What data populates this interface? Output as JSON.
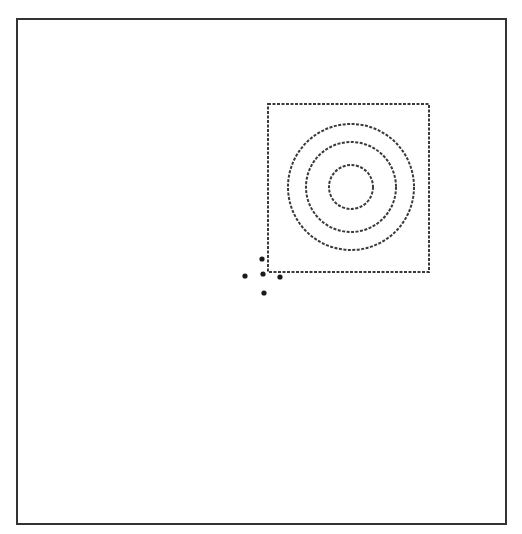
{
  "diagram": {
    "frame": {
      "x": 17,
      "y": 19,
      "width": 489,
      "height": 505,
      "stroke": "#333333",
      "stroke_width": 2
    },
    "square": {
      "x": 268,
      "y": 104,
      "width": 161,
      "height": 168,
      "stroke": "#3a3a3a",
      "dash": "3 1.5",
      "stroke_width": 2
    },
    "circles": {
      "cx": 351,
      "cy": 187,
      "radii": [
        22,
        45,
        63
      ],
      "stroke": "#3a3a3a",
      "dash": "3 1.5",
      "stroke_width": 2
    },
    "points": [
      {
        "x": 262,
        "y": 259
      },
      {
        "x": 245,
        "y": 276
      },
      {
        "x": 263,
        "y": 274
      },
      {
        "x": 280,
        "y": 277
      },
      {
        "x": 264,
        "y": 293
      }
    ],
    "point_radius": 2.6,
    "point_color": "#1a1a1a"
  }
}
